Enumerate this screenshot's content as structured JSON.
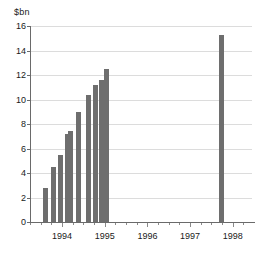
{
  "chart_data": {
    "type": "bar",
    "title": "",
    "xlabel": "",
    "ylabel": "$bn",
    "unit_caption": "$bn",
    "ylim": [
      0,
      16
    ],
    "ytick_labels": [
      "0",
      "2",
      "4",
      "6",
      "8",
      "10",
      "12",
      "14",
      "16"
    ],
    "ytick_values": [
      0,
      2,
      4,
      6,
      8,
      10,
      12,
      14,
      16
    ],
    "xtick_labels": [
      "1994",
      "1995",
      "1996",
      "1997",
      "1998"
    ],
    "xtick_values": [
      1994,
      1995,
      1996,
      1997,
      1998
    ],
    "xlim": [
      1993.25,
      1998.45
    ],
    "grid": "horizontal",
    "legend": "none",
    "bar_color": "#6e6e6e",
    "axis_color": "#6a6a6a",
    "gridline_color": "#dcdcdc",
    "series": [
      {
        "name": "Value",
        "x": [
          1993.62,
          1993.79,
          1993.96,
          1994.13,
          1994.21,
          1994.38,
          1994.62,
          1994.79,
          1994.92,
          1995.04,
          1997.74
        ],
        "values": [
          2.8,
          4.5,
          5.5,
          7.2,
          7.4,
          9.0,
          10.4,
          11.2,
          11.6,
          12.5,
          15.3
        ]
      }
    ],
    "bars": [
      {
        "label": "1993.62",
        "value": 2.8
      },
      {
        "label": "1993.79",
        "value": 4.5
      },
      {
        "label": "1993.96",
        "value": 5.5
      },
      {
        "label": "1994.13",
        "value": 7.2
      },
      {
        "label": "1994.21",
        "value": 7.4
      },
      {
        "label": "1994.38",
        "value": 9.0
      },
      {
        "label": "1994.62",
        "value": 10.4
      },
      {
        "label": "1994.79",
        "value": 11.2
      },
      {
        "label": "1994.92",
        "value": 11.6
      },
      {
        "label": "1995.04",
        "value": 12.5
      },
      {
        "label": "1997.74",
        "value": 15.3
      }
    ]
  }
}
